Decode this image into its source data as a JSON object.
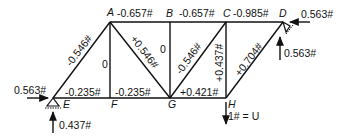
{
  "nodes": {
    "A": "A",
    "B": "B",
    "C": "C",
    "D": "D",
    "E": "E",
    "F": "F",
    "G": "G",
    "H": "H"
  },
  "members": {
    "EA": "-0.546#",
    "AB": "-0.657#",
    "BC": "-0.657#",
    "CD": "-0.985#",
    "AF": "0",
    "AG": "+0.546#",
    "BG": "0",
    "GC": "-0.546#",
    "CH": "+0.437#",
    "HD": "+0.704#",
    "EF": "-0.235#",
    "FG": "-0.235#",
    "GH": "+0.421#"
  },
  "loads": {
    "E_horizontal": "0.563#",
    "E_vertical": "0.437#",
    "D_horizontal": "0.563#",
    "D_vertical": "0.563#",
    "H_load": "1# = U"
  }
}
